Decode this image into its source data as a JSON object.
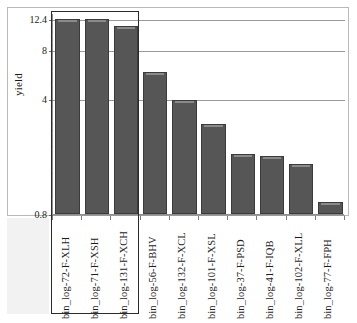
{
  "chart_data": {
    "type": "bar",
    "title": "",
    "xlabel": "",
    "ylabel": "yield",
    "yscale": "log",
    "ylim": [
      0.8,
      12.4
    ],
    "ytick_values": [
      0.8,
      4,
      8,
      12.4
    ],
    "ytick_labels": [
      "0.8",
      "4",
      "8",
      "12.4"
    ],
    "grid": true,
    "legend": "none",
    "bar_color": "#565656",
    "bar_edge_color": "#3b3b3b",
    "categories": [
      "bin_log-72-F-XLH",
      "bin_log-71-F-XSH",
      "bin_log-131-F-XCH",
      "bin_log-56-F-BHV",
      "bin_log-132-F-XCL",
      "bin_log-101-F-XSL",
      "bin_log-37-F-PSD",
      "bin_log-41-F-IQB",
      "bin_log-102-F-XLL",
      "bin_log-77-F-FPH"
    ],
    "values": [
      12.4,
      12.35,
      11.2,
      5.9,
      3.95,
      2.85,
      1.85,
      1.8,
      1.62,
      0.95
    ],
    "selection": {
      "label": "selected-bars-box",
      "start_index": 0,
      "end_index": 2,
      "categories": [
        "bin_log-72-F-XLH",
        "bin_log-71-F-XSH",
        "bin_log-131-F-XCH"
      ],
      "border_color": "#2b2b2b"
    }
  }
}
